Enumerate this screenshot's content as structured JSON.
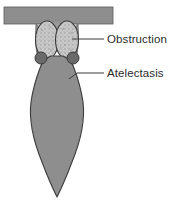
{
  "figure": {
    "type": "medical-illustration",
    "background_color": "#ffffff"
  },
  "colors": {
    "airway_fill": "#8e8e8e",
    "airway_stroke": "#4a4a4a",
    "lung_fill": "#8e8e8e",
    "lung_stroke": "#3c3c3c",
    "obstruction_fill": "#c9c9c9",
    "obstruction_stroke": "#3a3a3a",
    "nodule_fill": "#6a6a6a",
    "nodule_stroke": "#3a3a3a",
    "leader_line": "#3a3a3a",
    "label_text": "#2b2b2b"
  },
  "labels": [
    {
      "id": "obstruction",
      "text": "Obstruction",
      "leader": {
        "from_x": 72,
        "from_y": 39,
        "to_x": 104,
        "to_y": 39
      }
    },
    {
      "id": "atelectasis",
      "text": "Atelectasis",
      "leader": {
        "from_x": 70,
        "from_y": 78,
        "elbow_x": 78,
        "elbow_y": 73,
        "to_x": 104,
        "to_y": 73
      }
    }
  ],
  "structures": [
    {
      "id": "bronchus-bar",
      "name": "horizontal airway",
      "x": 4,
      "y": 7,
      "width": 109,
      "height": 17
    },
    {
      "id": "obstruction-left-oval",
      "name": "left stippled obstruction mass",
      "cx": 47,
      "cy": 40,
      "rx": 11,
      "ry": 19
    },
    {
      "id": "obstruction-right-oval",
      "name": "right stippled obstruction mass",
      "cx": 67,
      "cy": 40,
      "rx": 11,
      "ry": 19
    },
    {
      "id": "nodule-left",
      "name": "left dark nodule",
      "cx": 41,
      "cy": 58,
      "r": 6
    },
    {
      "id": "nodule-right",
      "name": "right dark nodule",
      "cx": 73,
      "cy": 58,
      "r": 6
    },
    {
      "id": "atelectatic-lobe",
      "name": "collapsed wedge-shaped lobe",
      "apex_x": 57,
      "apex_y": 197
    }
  ]
}
